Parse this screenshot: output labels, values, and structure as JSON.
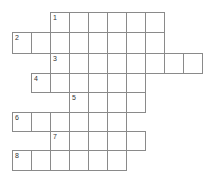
{
  "puzzle": {
    "type": "crossword",
    "cell_size": 19,
    "origin_x": 12,
    "origin_y": 12,
    "rows": [
      {
        "number": "1",
        "row": 0,
        "start_col": 2,
        "length": 6
      },
      {
        "number": "2",
        "row": 1,
        "start_col": 0,
        "length": 8
      },
      {
        "number": "3",
        "row": 2,
        "start_col": 2,
        "length": 8
      },
      {
        "number": "4",
        "row": 3,
        "start_col": 1,
        "length": 6
      },
      {
        "number": "5",
        "row": 4,
        "start_col": 3,
        "length": 4
      },
      {
        "number": "6",
        "row": 5,
        "start_col": 0,
        "length": 6
      },
      {
        "number": "7",
        "row": 6,
        "start_col": 2,
        "length": 5
      },
      {
        "number": "8",
        "row": 7,
        "start_col": 0,
        "length": 6
      }
    ]
  }
}
